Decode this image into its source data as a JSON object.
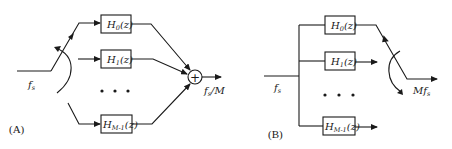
{
  "panel_a": {
    "label": "(A)",
    "input_rate": "f",
    "input_rate_sub": "s",
    "output_rate_main": "f",
    "output_rate_sub": "s",
    "output_rate_suffix": "/M",
    "summer_symbol": "+",
    "filters": [
      {
        "name": "H",
        "sub": "0",
        "arg": "(z)"
      },
      {
        "name": "H",
        "sub": "1",
        "arg": "(z)"
      },
      {
        "name": "H",
        "sub": "M-1",
        "arg": "(z)"
      }
    ],
    "ellipsis": "• • •"
  },
  "panel_b": {
    "label": "(B)",
    "input_rate": "f",
    "input_rate_sub": "s",
    "output_rate_prefix": "M",
    "output_rate_main": "f",
    "output_rate_sub": "s",
    "filters": [
      {
        "name": "H",
        "sub": "0",
        "arg": "(z)"
      },
      {
        "name": "H",
        "sub": "1",
        "arg": "(z)"
      },
      {
        "name": "H",
        "sub": "M-1",
        "arg": "(z)"
      }
    ],
    "ellipsis": "• • •"
  }
}
